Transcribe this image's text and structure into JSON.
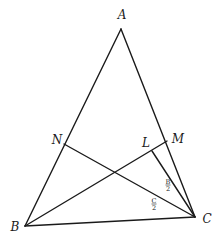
{
  "diagram": {
    "type": "triangle-geometry",
    "points": {
      "A": {
        "label": "A",
        "x": 121,
        "y": 29,
        "lx": 122,
        "ly": 19
      },
      "B": {
        "label": "B",
        "x": 25,
        "y": 226,
        "lx": 15,
        "ly": 231
      },
      "C": {
        "label": "C",
        "x": 195,
        "y": 217,
        "lx": 207,
        "ly": 223
      },
      "N": {
        "label": "N",
        "x": 64,
        "y": 144,
        "lx": 57,
        "ly": 144
      },
      "M": {
        "label": "M",
        "x": 167,
        "y": 141,
        "lx": 178,
        "ly": 143
      },
      "L": {
        "label": "L",
        "x": 152,
        "y": 151,
        "lx": 146,
        "ly": 147
      }
    },
    "segments": [
      {
        "from": "A",
        "to": "B"
      },
      {
        "from": "A",
        "to": "C"
      },
      {
        "from": "B",
        "to": "C"
      },
      {
        "from": "N",
        "to": "C"
      },
      {
        "from": "B",
        "to": "M"
      },
      {
        "from": "L",
        "to": "C"
      }
    ],
    "angle_labels": [
      {
        "num": "B",
        "den": "2",
        "x": 168,
        "y": 185
      },
      {
        "num": "C",
        "den": "2",
        "x": 154,
        "y": 204
      }
    ]
  }
}
